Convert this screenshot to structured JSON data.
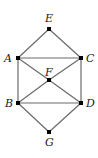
{
  "diagram": {
    "type": "graph",
    "nodes": [
      {
        "id": "E",
        "label": "E",
        "x": 49,
        "y": 29
      },
      {
        "id": "A",
        "label": "A",
        "x": 18,
        "y": 58
      },
      {
        "id": "C",
        "label": "C",
        "x": 81,
        "y": 58
      },
      {
        "id": "F",
        "label": "F",
        "x": 49,
        "y": 80
      },
      {
        "id": "B",
        "label": "B",
        "x": 18,
        "y": 103
      },
      {
        "id": "D",
        "label": "D",
        "x": 81,
        "y": 103
      },
      {
        "id": "G",
        "label": "G",
        "x": 49,
        "y": 132
      }
    ],
    "edges": [
      [
        "E",
        "A"
      ],
      [
        "E",
        "C"
      ],
      [
        "A",
        "C"
      ],
      [
        "A",
        "F"
      ],
      [
        "C",
        "F"
      ],
      [
        "A",
        "B"
      ],
      [
        "C",
        "D"
      ],
      [
        "F",
        "B"
      ],
      [
        "F",
        "D"
      ],
      [
        "B",
        "D"
      ],
      [
        "B",
        "G"
      ],
      [
        "D",
        "G"
      ]
    ],
    "colors": {
      "edge": "#6a6a6a",
      "node": "#000000",
      "label": "#222222"
    }
  }
}
